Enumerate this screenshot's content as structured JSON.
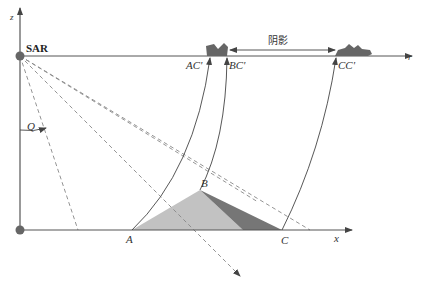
{
  "diagram": {
    "labels": {
      "z_axis": "z",
      "x_axis": "x",
      "r_axis": "r",
      "sar": "SAR",
      "angle": "Q",
      "point_a": "A",
      "point_b": "B",
      "point_c": "C",
      "proj_a": "AC'",
      "proj_b": "BC'",
      "proj_c": "CC'",
      "shadow": "阴影"
    },
    "colors": {
      "axis": "#555555",
      "sar_dot": "#666666",
      "lit_slope": "#c0c0c0",
      "shadow_slope": "#777777",
      "image_blob": "#666666",
      "dashed": "#888888"
    }
  }
}
